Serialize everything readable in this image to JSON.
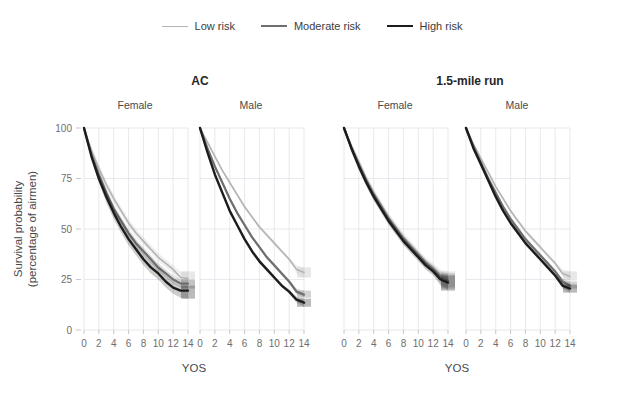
{
  "legend": {
    "position": "top-center",
    "entries": [
      {
        "label": "Low risk",
        "color": "#b4b4b4",
        "width": 1.6
      },
      {
        "label": "Moderate risk",
        "color": "#6e6e6e",
        "width": 2.2
      },
      {
        "label": "High risk",
        "color": "#1c1c1c",
        "width": 2.4
      }
    ]
  },
  "groups": [
    {
      "title": "AC",
      "panels": [
        "Female",
        "Male"
      ]
    },
    {
      "title": "1.5-mile run",
      "panels": [
        "Female",
        "Male"
      ]
    }
  ],
  "axes": {
    "xlabel": "YOS",
    "ylabel_line1": "Survival probability",
    "ylabel_line2": "(percentage of airmen)",
    "xticks": [
      0,
      2,
      4,
      6,
      8,
      10,
      12,
      14
    ],
    "yticks": [
      0,
      25,
      50,
      75,
      100
    ],
    "xlim": [
      0,
      14
    ],
    "ylim": [
      0,
      100
    ],
    "grid": true
  },
  "chart_data": {
    "type": "line",
    "title": "",
    "subtitle": "",
    "xlabel": "YOS",
    "ylabel": "Survival probability (percentage of airmen)",
    "xlim": [
      0,
      14
    ],
    "ylim": [
      0,
      100
    ],
    "grid": true,
    "legend_position": "top-center",
    "x": [
      0,
      1,
      2,
      3,
      4,
      5,
      6,
      7,
      8,
      9,
      10,
      11,
      12,
      13,
      14
    ],
    "panels": [
      {
        "group": "AC",
        "panel": "Female",
        "series": [
          {
            "name": "Low risk",
            "color": "#b4b4b4",
            "values": [
              100,
              89,
              80,
              72,
              65,
              59,
              53,
              48,
              44,
              40,
              36,
              33,
              30,
              26,
              25.5
            ],
            "ci_low": [
              100,
              87,
              78,
              70,
              63,
              57,
              51,
              46,
              42,
              38,
              34,
              31,
              28,
              23,
              22
            ],
            "ci_high": [
              100,
              91,
              82,
              74,
              67,
              61,
              55,
              50,
              46,
              42,
              38,
              35,
              32,
              29,
              29
            ]
          },
          {
            "name": "Moderate risk",
            "color": "#6e6e6e",
            "values": [
              100,
              87,
              77,
              68,
              60,
              54,
              48,
              43,
              39,
              35,
              31,
              28,
              25,
              23,
              23
            ],
            "ci_low": [
              100,
              85,
              75,
              66,
              58,
              52,
              46,
              41,
              37,
              33,
              29,
              26,
              23,
              21,
              20.5
            ],
            "ci_high": [
              100,
              89,
              79,
              70,
              62,
              56,
              50,
              45,
              41,
              37,
              33,
              30,
              27,
              25,
              25
            ]
          },
          {
            "name": "High risk",
            "color": "#1c1c1c",
            "values": [
              100,
              86,
              75,
              66,
              58,
              51,
              45,
              40,
              35,
              31,
              28,
              24,
              21,
              19.5,
              19.5
            ],
            "ci_low": [
              100,
              84,
              73,
              63,
              55,
              48,
              42,
              37,
              32,
              28,
              25,
              21,
              18,
              16,
              15.5
            ],
            "ci_high": [
              100,
              88,
              77,
              69,
              61,
              54,
              48,
              43,
              38,
              34,
              31,
              27,
              24,
              22,
              22
            ]
          }
        ]
      },
      {
        "group": "AC",
        "panel": "Male",
        "series": [
          {
            "name": "Low risk",
            "color": "#b4b4b4",
            "values": [
              100,
              93,
              86,
              79,
              73,
              67,
              61,
              56,
              51,
              47,
              43,
              39,
              35,
              30,
              28.5
            ],
            "ci_low": [
              100,
              92,
              85,
              78,
              72,
              66,
              60,
              55,
              50,
              46,
              42,
              38,
              34,
              28,
              26
            ],
            "ci_high": [
              100,
              94,
              87,
              80,
              74,
              68,
              62,
              57,
              52,
              48,
              44,
              40,
              36,
              32,
              31
            ]
          },
          {
            "name": "Moderate risk",
            "color": "#6e6e6e",
            "values": [
              100,
              90,
              81,
              73,
              65,
              58,
              52,
              46,
              41,
              36,
              32,
              28,
              24,
              19,
              17.5
            ],
            "ci_low": [
              100,
              89,
              80,
              72,
              64,
              57,
              51,
              45,
              40,
              35,
              31,
              27,
              23,
              17.5,
              16
            ],
            "ci_high": [
              100,
              91,
              82,
              74,
              66,
              59,
              53,
              47,
              42,
              37,
              33,
              29,
              25,
              20.5,
              19.5
            ]
          },
          {
            "name": "High risk",
            "color": "#1c1c1c",
            "values": [
              100,
              88,
              77,
              68,
              59,
              52,
              45,
              39,
              34,
              30,
              26,
              22,
              19,
              15,
              13.5
            ],
            "ci_low": [
              100,
              87,
              76,
              67,
              58,
              51,
              44,
              38,
              33,
              29,
              25,
              21,
              18,
              13.5,
              11.5
            ],
            "ci_high": [
              100,
              89,
              78,
              69,
              60,
              53,
              46,
              40,
              35,
              31,
              27,
              23,
              20,
              16.5,
              15.5
            ]
          }
        ]
      },
      {
        "group": "1.5-mile run",
        "panel": "Female",
        "series": [
          {
            "name": "Low risk",
            "color": "#b4b4b4",
            "values": [
              100,
              91,
              83,
              75,
              68,
              62,
              56,
              51,
              46,
              42,
              38,
              34,
              31,
              27,
              25.5
            ],
            "ci_low": [
              100,
              89,
              81,
              73,
              66,
              60,
              54,
              49,
              44,
              40,
              36,
              32,
              29,
              24,
              21.5
            ],
            "ci_high": [
              100,
              93,
              85,
              77,
              70,
              64,
              58,
              53,
              48,
              44,
              40,
              36,
              33,
              30,
              29
            ]
          },
          {
            "name": "Moderate risk",
            "color": "#6e6e6e",
            "values": [
              100,
              90,
              82,
              74,
              67,
              61,
              55,
              50,
              45,
              41,
              37,
              33,
              30,
              26,
              24.5
            ],
            "ci_low": [
              100,
              88,
              80,
              72,
              65,
              59,
              53,
              48,
              43,
              39,
              35,
              31,
              28,
              23,
              20.5
            ],
            "ci_high": [
              100,
              92,
              84,
              76,
              69,
              63,
              57,
              52,
              47,
              43,
              39,
              35,
              32,
              29,
              28
            ]
          },
          {
            "name": "High risk",
            "color": "#1c1c1c",
            "values": [
              100,
              90,
              81,
              73,
              66,
              60,
              54,
              49,
              44,
              40,
              36,
              32,
              29,
              25,
              23.5
            ],
            "ci_low": [
              100,
              88,
              79,
              71,
              64,
              58,
              52,
              47,
              42,
              38,
              34,
              30,
              27,
              22,
              19.5
            ],
            "ci_high": [
              100,
              92,
              83,
              75,
              68,
              62,
              56,
              51,
              46,
              42,
              38,
              34,
              31,
              28,
              27
            ]
          }
        ]
      },
      {
        "group": "1.5-mile run",
        "panel": "Male",
        "series": [
          {
            "name": "Low risk",
            "color": "#b4b4b4",
            "values": [
              100,
              92,
              85,
              78,
              71,
              65,
              59,
              54,
              49,
              45,
              41,
              37,
              33,
              28,
              26.5
            ],
            "ci_low": [
              100,
              91,
              84,
              77,
              70,
              64,
              58,
              53,
              48,
              44,
              40,
              36,
              32,
              26.5,
              24.5
            ],
            "ci_high": [
              100,
              93,
              86,
              79,
              72,
              66,
              60,
              55,
              50,
              46,
              42,
              38,
              34,
              30,
              29
            ]
          },
          {
            "name": "Moderate risk",
            "color": "#6e6e6e",
            "values": [
              100,
              91,
              83,
              75,
              68,
              61,
              55,
              50,
              45,
              41,
              37,
              33,
              29,
              24,
              22
            ],
            "ci_low": [
              100,
              90,
              82,
              74,
              67,
              60,
              54,
              49,
              44,
              40,
              36,
              32,
              28,
              22.5,
              20.5
            ],
            "ci_high": [
              100,
              92,
              84,
              76,
              69,
              62,
              56,
              51,
              46,
              42,
              38,
              34,
              30,
              25.5,
              24
            ]
          },
          {
            "name": "High risk",
            "color": "#1c1c1c",
            "values": [
              100,
              90,
              82,
              74,
              66,
              59,
              53,
              48,
              43,
              39,
              35,
              31,
              27,
              22,
              20.5
            ],
            "ci_low": [
              100,
              89,
              81,
              73,
              65,
              58,
              52,
              47,
              42,
              38,
              34,
              30,
              26,
              20.5,
              18.5
            ],
            "ci_high": [
              100,
              91,
              83,
              75,
              67,
              60,
              54,
              49,
              44,
              40,
              36,
              32,
              28,
              23.5,
              22.5
            ]
          }
        ]
      }
    ]
  }
}
